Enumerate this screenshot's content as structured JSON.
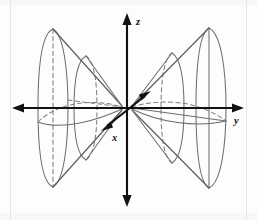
{
  "figure": {
    "background_color": "#fdfdfd",
    "axis_color": "#121212",
    "surface_color": "#6e6e72",
    "hidden_edge_color": "#7e7e84",
    "width": 257,
    "height": 220
  },
  "axes": {
    "origin": {
      "x": 127,
      "y": 108
    },
    "items": [
      {
        "id": "z",
        "label": "z",
        "orientation": "vertical",
        "arrowheads": "both",
        "from": {
          "x": 127,
          "y": 205
        },
        "to": {
          "x": 127,
          "y": 14
        },
        "label_pos": {
          "x": 135,
          "y": 21
        }
      },
      {
        "id": "y",
        "label": "y",
        "orientation": "horizontal",
        "arrowheads": "both",
        "from": {
          "x": 14,
          "y": 108
        },
        "to": {
          "x": 243,
          "y": 108
        },
        "label_pos": {
          "x": 237,
          "y": 122
        }
      },
      {
        "id": "x",
        "label": "x",
        "orientation": "diagonal",
        "arrowheads": "both",
        "from": {
          "x": 103,
          "y": 129
        },
        "to": {
          "x": 148,
          "y": 93
        },
        "label_pos": {
          "x": 116,
          "y": 140
        }
      }
    ]
  },
  "surface": {
    "name": "double-napped-elliptical-cone",
    "axis_of_symmetry": "y",
    "nappes": [
      {
        "id": "left-nappe",
        "direction": "negative-y",
        "vertex": {
          "x": 122,
          "y": 108
        }
      },
      {
        "id": "right-nappe",
        "direction": "positive-y",
        "vertex": {
          "x": 132,
          "y": 108
        }
      }
    ],
    "cross_sections": [
      {
        "id": "left-outer-rim",
        "center_x": 53,
        "ry": 79,
        "rx": 15,
        "style": "solid-front-dashed-back"
      },
      {
        "id": "left-inner-rim",
        "center_x": 84,
        "ry": 52,
        "rx": 11,
        "style": "solid-front-dashed-back"
      },
      {
        "id": "right-inner-rim",
        "center_x": 173,
        "ry": 55,
        "rx": 11,
        "style": "solid-front-dashed-back"
      },
      {
        "id": "right-outer-rim",
        "center_x": 211,
        "ry": 80,
        "rx": 15,
        "style": "solid"
      }
    ]
  },
  "labels": {
    "z_axis": "z",
    "y_axis": "y",
    "x_axis": "x"
  }
}
